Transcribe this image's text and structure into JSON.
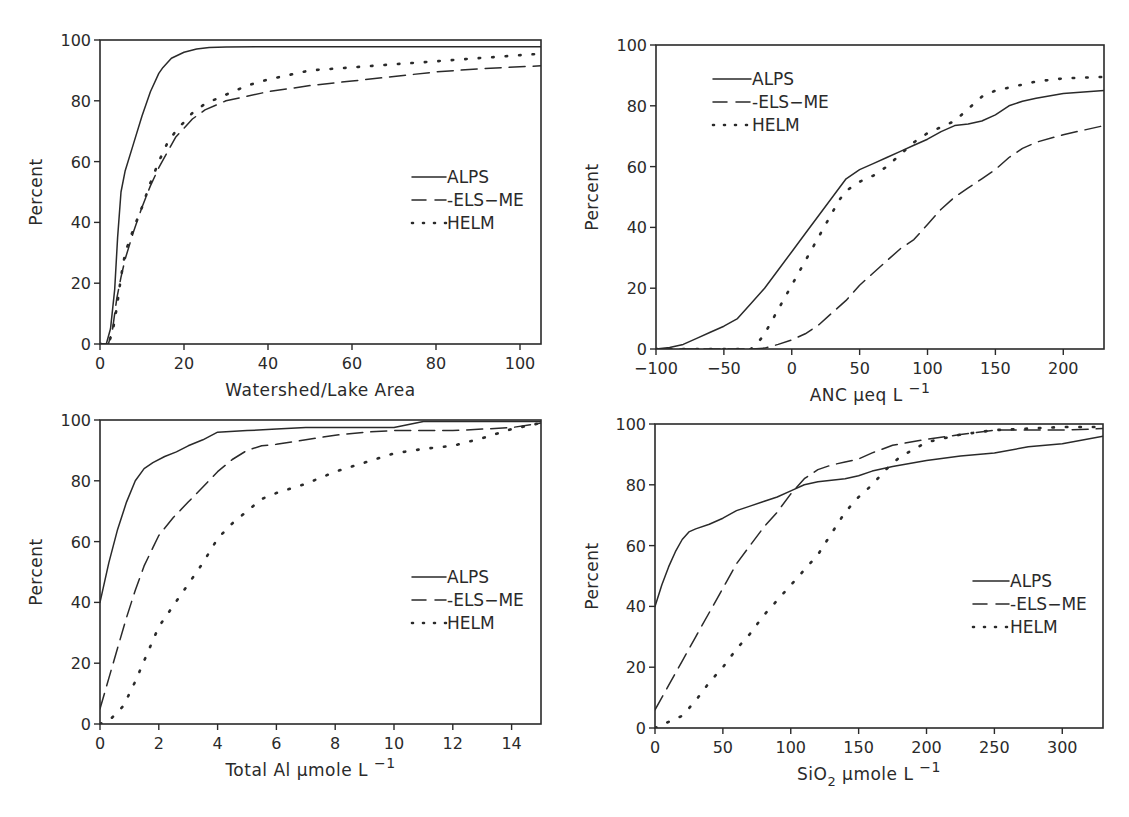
{
  "chart_data": [
    {
      "id": "panel-watershed",
      "type": "line",
      "title": "",
      "xlabel": "Watershed/Lake Area",
      "ylabel": "Percent",
      "xlim": [
        0,
        105
      ],
      "ylim": [
        0,
        100
      ],
      "xticks": [
        0,
        20,
        40,
        60,
        80,
        100
      ],
      "yticks": [
        0,
        20,
        40,
        60,
        80,
        100
      ],
      "grid": false,
      "legend_position": "center-right",
      "series": [
        {
          "name": "ALPS",
          "style": "solid",
          "x": [
            0,
            1.5,
            2.5,
            3.5,
            4.2,
            5,
            6,
            8,
            10,
            12,
            14,
            15,
            17,
            20,
            23,
            26,
            30,
            40,
            60,
            80,
            105
          ],
          "y": [
            0,
            0,
            5,
            18,
            35,
            50,
            57,
            66,
            75,
            83,
            89,
            91,
            94,
            96,
            97,
            97.5,
            97.7,
            97.8,
            97.8,
            97.8,
            97.8
          ]
        },
        {
          "name": "ELS-ME",
          "style": "dashed",
          "x": [
            0,
            2,
            3,
            4,
            5,
            6,
            8,
            10,
            12,
            14,
            16,
            18,
            20,
            22,
            25,
            30,
            40,
            50,
            60,
            70,
            80,
            90,
            105
          ],
          "y": [
            0,
            0,
            5,
            15,
            22,
            28,
            37,
            45,
            52,
            58,
            63,
            68,
            71,
            74,
            77,
            80,
            83,
            85,
            86.5,
            88,
            89.5,
            90.5,
            91.5
          ]
        },
        {
          "name": "HELM",
          "style": "dotted",
          "x": [
            0,
            2,
            3,
            4,
            5,
            6,
            8,
            10,
            12,
            14,
            16,
            18,
            20,
            22,
            25,
            30,
            35,
            40,
            50,
            60,
            70,
            80,
            90,
            105
          ],
          "y": [
            0,
            0,
            4,
            12,
            22,
            30,
            38,
            45,
            53,
            60,
            66,
            70,
            73,
            76,
            79,
            82,
            85,
            87,
            90,
            91,
            92,
            93,
            94,
            95.5
          ]
        }
      ]
    },
    {
      "id": "panel-anc",
      "type": "line",
      "title": "",
      "xlabel": "ANC µeq L",
      "xlabel_sup": "−1",
      "ylabel": "Percent",
      "xlim": [
        -100,
        230
      ],
      "ylim": [
        0,
        100
      ],
      "xticks": [
        -100,
        -50,
        0,
        50,
        100,
        150,
        200
      ],
      "xtick_labels": [
        "−100",
        "−50",
        "0",
        "50",
        "100",
        "150",
        "200"
      ],
      "yticks": [
        0,
        20,
        40,
        60,
        80,
        100
      ],
      "grid": false,
      "legend_position": "upper-left",
      "series": [
        {
          "name": "ALPS",
          "style": "solid",
          "x": [
            -100,
            -90,
            -80,
            -70,
            -60,
            -50,
            -40,
            -30,
            -20,
            -10,
            0,
            10,
            20,
            30,
            40,
            50,
            60,
            70,
            80,
            90,
            100,
            110,
            120,
            130,
            140,
            150,
            160,
            170,
            180,
            200,
            230
          ],
          "y": [
            0,
            0.5,
            1.5,
            3.5,
            5.5,
            7.5,
            10,
            15,
            20,
            26,
            32,
            38,
            44,
            50,
            56,
            59,
            61,
            63,
            65,
            67,
            69,
            71.5,
            73.5,
            74,
            75,
            77,
            80,
            81.5,
            82.5,
            84,
            85
          ]
        },
        {
          "name": "ELS-ME",
          "style": "dashed",
          "x": [
            -100,
            -30,
            -20,
            -10,
            0,
            10,
            20,
            30,
            40,
            50,
            60,
            70,
            80,
            90,
            100,
            110,
            120,
            130,
            140,
            150,
            160,
            170,
            180,
            200,
            230
          ],
          "y": [
            0,
            0,
            0.3,
            1.5,
            3,
            5,
            8,
            12,
            16,
            21,
            25,
            29,
            33,
            36,
            41,
            46,
            50,
            53,
            56,
            59,
            63,
            66,
            68,
            70.5,
            73.5
          ]
        },
        {
          "name": "HELM",
          "style": "dotted",
          "x": [
            -100,
            -30,
            -25,
            -20,
            -15,
            -10,
            -5,
            0,
            5,
            10,
            15,
            20,
            25,
            30,
            35,
            40,
            50,
            60,
            70,
            80,
            90,
            100,
            110,
            120,
            130,
            140,
            150,
            160,
            180,
            200,
            230
          ],
          "y": [
            0,
            0,
            2,
            5,
            9,
            13,
            17,
            21,
            25,
            29,
            33,
            37,
            41,
            45,
            49,
            52,
            55,
            57,
            60,
            64,
            68,
            71,
            73,
            75,
            79,
            83,
            85,
            86,
            88,
            89,
            89.5
          ]
        }
      ]
    },
    {
      "id": "panel-aluminum",
      "type": "line",
      "title": "",
      "xlabel": "Total Al µmole L",
      "xlabel_sup": "−1",
      "ylabel": "Percent",
      "xlim": [
        0,
        15
      ],
      "ylim": [
        0,
        100
      ],
      "xticks": [
        0,
        2,
        4,
        6,
        8,
        10,
        12,
        14
      ],
      "yticks": [
        0,
        20,
        40,
        60,
        80,
        100
      ],
      "grid": false,
      "legend_position": "center-right",
      "series": [
        {
          "name": "ALPS",
          "style": "solid",
          "x": [
            0,
            0.3,
            0.6,
            0.9,
            1.2,
            1.5,
            1.8,
            2.2,
            2.6,
            3,
            3.5,
            4,
            5,
            6,
            7,
            8,
            9,
            10,
            10.5,
            11,
            12,
            13,
            15
          ],
          "y": [
            40,
            53,
            64,
            73,
            80,
            84,
            86,
            88,
            89.5,
            91.5,
            93.5,
            96,
            96.5,
            97,
            97.5,
            97.5,
            97.5,
            97.5,
            98.5,
            99.5,
            99.5,
            99.5,
            99.5
          ]
        },
        {
          "name": "ELS-ME",
          "style": "dashed",
          "x": [
            0,
            0.3,
            0.6,
            0.9,
            1.2,
            1.5,
            1.8,
            2,
            2.5,
            3,
            3.5,
            4,
            4.5,
            5,
            5.5,
            6,
            7,
            8,
            9,
            10,
            11,
            12,
            13,
            14,
            15
          ],
          "y": [
            5,
            15,
            25,
            35,
            44,
            52,
            58,
            62,
            68,
            73,
            78,
            83,
            87,
            90,
            91.5,
            92,
            93.5,
            95,
            96,
            96.5,
            96.5,
            96.5,
            97,
            97.5,
            99
          ]
        },
        {
          "name": "HELM",
          "style": "dotted",
          "x": [
            0,
            0.4,
            0.8,
            1.2,
            1.6,
            2,
            2.5,
            3,
            3.5,
            4,
            4.5,
            5,
            5.5,
            6,
            7,
            8,
            9,
            10,
            11,
            12,
            13,
            14,
            15
          ],
          "y": [
            0,
            2,
            6,
            14,
            23,
            32,
            39,
            46,
            53,
            61,
            66,
            70,
            74,
            76,
            79,
            83,
            86,
            89,
            90.5,
            91.5,
            94,
            97,
            99
          ]
        }
      ]
    },
    {
      "id": "panel-silica",
      "type": "line",
      "title": "",
      "xlabel": "SiO",
      "xlabel_sub": "2",
      "xlabel_rest": "µmole L",
      "xlabel_sup": "−1",
      "ylabel": "Percent",
      "xlim": [
        0,
        330
      ],
      "ylim": [
        0,
        100
      ],
      "xticks": [
        0,
        50,
        100,
        150,
        200,
        250,
        300
      ],
      "yticks": [
        0,
        20,
        40,
        60,
        80,
        100
      ],
      "grid": false,
      "legend_position": "center-right",
      "series": [
        {
          "name": "ALPS",
          "style": "solid",
          "x": [
            0,
            5,
            10,
            15,
            20,
            25,
            30,
            40,
            50,
            60,
            70,
            80,
            90,
            100,
            110,
            120,
            130,
            140,
            150,
            160,
            175,
            200,
            225,
            250,
            275,
            300,
            330
          ],
          "y": [
            40,
            47,
            53,
            58,
            62,
            64.5,
            65.5,
            67,
            69,
            71.5,
            73,
            74.5,
            76,
            78,
            80,
            81,
            81.5,
            82,
            83,
            84.5,
            86,
            88,
            89.5,
            90.5,
            92.5,
            93.5,
            96
          ]
        },
        {
          "name": "ELS-ME",
          "style": "dashed",
          "x": [
            0,
            10,
            20,
            30,
            40,
            50,
            60,
            70,
            80,
            90,
            100,
            110,
            120,
            130,
            140,
            150,
            160,
            175,
            200,
            225,
            250,
            275,
            300,
            330
          ],
          "y": [
            6,
            14,
            22,
            30,
            38,
            46,
            54,
            60,
            66,
            71,
            77,
            82,
            85,
            86.5,
            87.5,
            88.5,
            90.5,
            93,
            95,
            96.5,
            98,
            98,
            98,
            98.5
          ]
        },
        {
          "name": "HELM",
          "style": "dotted",
          "x": [
            0,
            10,
            20,
            30,
            40,
            50,
            60,
            70,
            80,
            90,
            100,
            110,
            120,
            130,
            140,
            150,
            160,
            170,
            180,
            200,
            225,
            250,
            275,
            300,
            330
          ],
          "y": [
            0,
            2,
            4,
            9,
            15,
            20,
            26,
            31,
            37,
            42,
            47,
            52,
            57,
            64,
            71,
            76,
            80,
            85,
            89,
            94,
            96.5,
            98,
            98.5,
            99,
            99
          ]
        }
      ]
    }
  ],
  "legend_labels": [
    "ALPS",
    "-ELS−ME",
    "HELM"
  ],
  "colors": {
    "ink": "#2a2a2a",
    "background": "#ffffff"
  }
}
